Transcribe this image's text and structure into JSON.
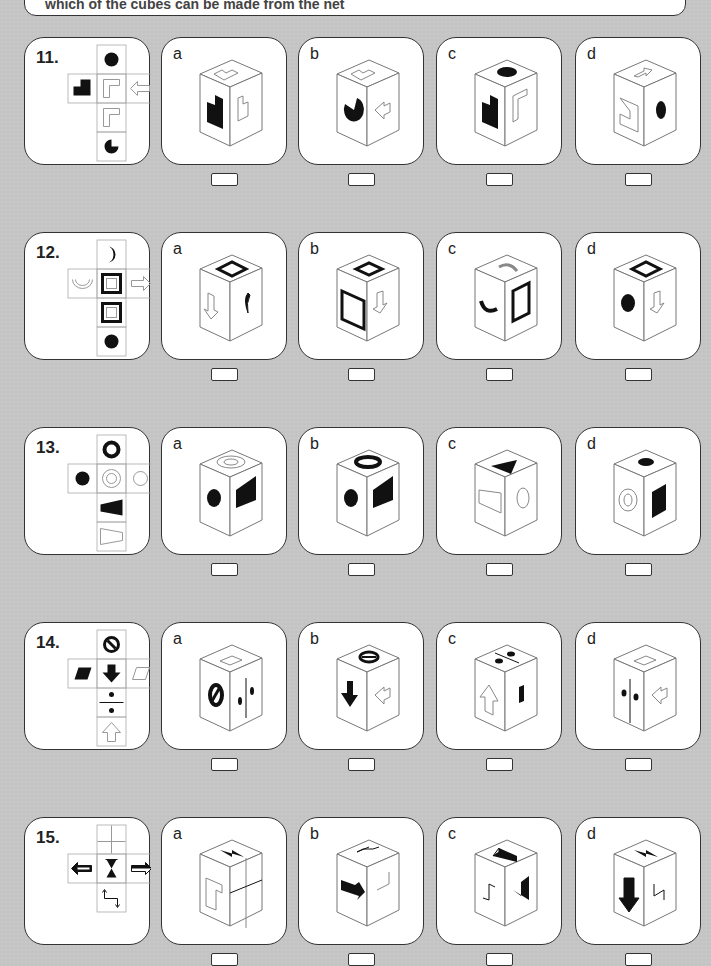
{
  "header": {
    "instruction_fragment": "which of the cubes can be made from the net"
  },
  "questions": [
    {
      "number": "11.",
      "net": {
        "top": "black-circle",
        "left": "black-l-shape",
        "center": "outline-l-shape",
        "right": "outline-left-arrow",
        "below": "outline-l-shape",
        "bottom": "black-pac-circle"
      },
      "options": [
        {
          "label": "a"
        },
        {
          "label": "b"
        },
        {
          "label": "c"
        },
        {
          "label": "d"
        }
      ]
    },
    {
      "number": "12.",
      "net": {
        "top": "black-crescent",
        "left": "outline-u-shape",
        "center": "thick-square-frame",
        "right": "outline-right-arrow",
        "below": "thick-square-frame",
        "bottom": "black-circle"
      },
      "options": [
        {
          "label": "a"
        },
        {
          "label": "b"
        },
        {
          "label": "c"
        },
        {
          "label": "d"
        }
      ]
    },
    {
      "number": "13.",
      "net": {
        "top": "black-ring",
        "left": "black-circle",
        "center": "double-outline-circle",
        "right": "outline-circle",
        "below": "black-trapezoid",
        "bottom": "outline-trapezoid"
      },
      "options": [
        {
          "label": "a"
        },
        {
          "label": "b"
        },
        {
          "label": "c"
        },
        {
          "label": "d"
        }
      ]
    },
    {
      "number": "14.",
      "net": {
        "top": "no-entry-sign",
        "left": "black-parallelogram",
        "center": "black-down-arrow",
        "right": "outline-parallelogram",
        "below": "division-sign",
        "bottom": "outline-up-arrow"
      },
      "options": [
        {
          "label": "a"
        },
        {
          "label": "b"
        },
        {
          "label": "c"
        },
        {
          "label": "d"
        }
      ]
    },
    {
      "number": "15.",
      "net": {
        "top": "cross-lines",
        "left": "black-left-arrow",
        "center": "black-hourglass",
        "right": "half-black-right-arrow",
        "below": "zigzag-arrow"
      },
      "options": [
        {
          "label": "a"
        },
        {
          "label": "b"
        },
        {
          "label": "c"
        },
        {
          "label": "d"
        }
      ]
    }
  ],
  "colors": {
    "background": "#c4c4c4",
    "card": "#ffffff",
    "ink": "#111111",
    "outline": "#888888"
  }
}
